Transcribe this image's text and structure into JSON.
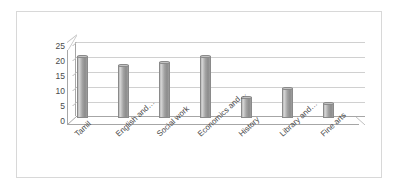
{
  "chart_data": {
    "type": "bar",
    "title": "",
    "subtitle": "",
    "xlabel": "",
    "ylabel": "",
    "categories": [
      "Tamil",
      "English and…",
      "Social work",
      "Economics and…",
      "History",
      "Library and…",
      "Fine arts"
    ],
    "values": [
      21,
      18,
      19,
      21,
      7,
      10,
      5
    ],
    "ylim": [
      0,
      25
    ],
    "yticks": [
      25,
      20,
      15,
      10,
      5,
      0
    ],
    "ytick_labels": [
      "25",
      "20",
      "15",
      "10",
      "5",
      "0"
    ],
    "grid": true,
    "legend": false,
    "legend_position": "none",
    "series": [
      {
        "name": "",
        "values": [
          21,
          18,
          19,
          21,
          7,
          10,
          5
        ]
      }
    ],
    "style": {
      "bar_color": "#a3a3a3",
      "bar_edge_color": "#8a8a8a",
      "gridline_color": "#d0d0d0",
      "axis_color": "#a6a6a6",
      "text_color": "#4a4a4a",
      "background_color": "#ffffff",
      "border_color": "#d8d8d8",
      "three_d": true
    }
  }
}
